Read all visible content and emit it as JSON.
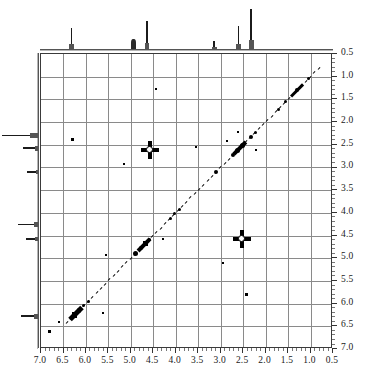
{
  "figure": {
    "kind": "2d-nmr-cosy-spectrum"
  },
  "axes": {
    "x": {
      "label": "",
      "unit": "ppm",
      "direction": "decreasing-left-to-right",
      "min": 0.5,
      "max": 7.0,
      "ticks": [
        "7.0",
        "6.5",
        "6.0",
        "5.5",
        "5.0",
        "4.5",
        "4.0",
        "3.5",
        "3.0",
        "2.5",
        "2.0",
        "1.5",
        "1.0",
        "0.5"
      ]
    },
    "y": {
      "label": "",
      "unit": "ppm",
      "direction": "increasing-top-to-bottom",
      "min": 0.5,
      "max": 7.0,
      "ticks": [
        "0.5",
        "1.0",
        "1.5",
        "2.0",
        "2.5",
        "3.0",
        "3.5",
        "4.0",
        "4.5",
        "5.0",
        "5.5",
        "6.0",
        "6.5",
        "7.0"
      ],
      "side": "right"
    }
  },
  "chart_data": {
    "type": "scatter",
    "title": "",
    "subtitle": "",
    "xlabel": "",
    "ylabel": "",
    "xlim": [
      7.0,
      0.5
    ],
    "ylim": [
      0.5,
      7.0
    ],
    "grid": true,
    "legend": "none",
    "series": [
      {
        "name": "diagonal",
        "points": [
          {
            "x": 6.25,
            "y": 6.25,
            "size": "large"
          },
          {
            "x": 6.15,
            "y": 6.15,
            "size": "medium"
          },
          {
            "x": 6.05,
            "y": 6.05,
            "size": "small"
          },
          {
            "x": 5.95,
            "y": 5.95,
            "size": "small"
          },
          {
            "x": 4.9,
            "y": 4.9,
            "size": "large"
          },
          {
            "x": 4.78,
            "y": 4.78,
            "size": "medium"
          },
          {
            "x": 4.68,
            "y": 4.68,
            "size": "large"
          },
          {
            "x": 4.58,
            "y": 4.58,
            "size": "small"
          },
          {
            "x": 4.12,
            "y": 4.12,
            "size": "small"
          },
          {
            "x": 4.02,
            "y": 4.02,
            "size": "small"
          },
          {
            "x": 3.92,
            "y": 3.92,
            "size": "small"
          },
          {
            "x": 3.1,
            "y": 3.1,
            "size": "medium"
          },
          {
            "x": 2.72,
            "y": 2.72,
            "size": "medium"
          },
          {
            "x": 2.62,
            "y": 2.62,
            "size": "large"
          },
          {
            "x": 2.52,
            "y": 2.52,
            "size": "large"
          },
          {
            "x": 2.32,
            "y": 2.32,
            "size": "medium"
          },
          {
            "x": 2.22,
            "y": 2.22,
            "size": "small"
          },
          {
            "x": 1.72,
            "y": 1.72,
            "size": "small"
          },
          {
            "x": 1.55,
            "y": 1.55,
            "size": "small"
          },
          {
            "x": 1.3,
            "y": 1.3,
            "size": "medium"
          },
          {
            "x": 1.05,
            "y": 1.05,
            "size": "small"
          }
        ]
      },
      {
        "name": "cross-peaks",
        "points": [
          {
            "x": 4.58,
            "y": 2.62,
            "size": "cross"
          },
          {
            "x": 2.52,
            "y": 4.58,
            "size": "cross"
          },
          {
            "x": 6.3,
            "y": 2.38,
            "size": "small"
          },
          {
            "x": 5.15,
            "y": 2.92,
            "size": "tiny"
          },
          {
            "x": 3.55,
            "y": 2.55,
            "size": "tiny"
          },
          {
            "x": 2.85,
            "y": 2.42,
            "size": "tiny"
          },
          {
            "x": 2.22,
            "y": 2.62,
            "size": "tiny"
          },
          {
            "x": 2.62,
            "y": 2.22,
            "size": "tiny"
          },
          {
            "x": 4.28,
            "y": 4.58,
            "size": "tiny"
          },
          {
            "x": 2.95,
            "y": 5.1,
            "size": "tiny"
          },
          {
            "x": 2.42,
            "y": 5.8,
            "size": "small"
          },
          {
            "x": 6.82,
            "y": 6.62,
            "size": "small"
          },
          {
            "x": 6.6,
            "y": 6.4,
            "size": "tiny"
          },
          {
            "x": 5.62,
            "y": 6.2,
            "size": "tiny"
          },
          {
            "x": 5.55,
            "y": 4.92,
            "size": "tiny"
          },
          {
            "x": 4.45,
            "y": 1.28,
            "size": "tiny"
          }
        ]
      }
    ],
    "projections": {
      "top": {
        "name": "f2-projection",
        "peaks": [
          {
            "ppm": 6.3,
            "height": 0.52
          },
          {
            "ppm": 4.92,
            "height": 0.26
          },
          {
            "ppm": 4.62,
            "height": 0.7
          },
          {
            "ppm": 3.12,
            "height": 0.2
          },
          {
            "ppm": 2.58,
            "height": 0.58
          },
          {
            "ppm": 2.3,
            "height": 1.0
          }
        ]
      },
      "left": {
        "name": "f1-projection",
        "peaks": [
          {
            "ppm": 2.32,
            "length": 1.0
          },
          {
            "ppm": 2.6,
            "length": 0.42
          },
          {
            "ppm": 3.12,
            "length": 0.3
          },
          {
            "ppm": 4.28,
            "length": 0.56
          },
          {
            "ppm": 4.6,
            "length": 0.34
          },
          {
            "ppm": 6.3,
            "length": 0.46
          }
        ]
      }
    }
  },
  "colors": {
    "background": "#ffffff",
    "frame": "#3a3a3a",
    "grid": "#8a8a8a",
    "peak": "#000000",
    "trace": "#1b1b1b"
  }
}
